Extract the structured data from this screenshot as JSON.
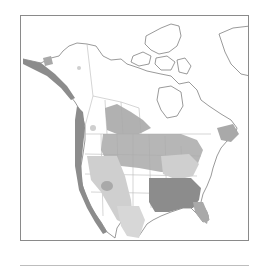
{
  "map": {
    "title": "North America range map",
    "region": "North America",
    "style": "grayscale",
    "legend_shades": [
      {
        "name": "dark",
        "color": "#8c8c8c"
      },
      {
        "name": "medium",
        "color": "#a9a9a9"
      },
      {
        "name": "light",
        "color": "#cfcfcf"
      },
      {
        "name": "unshaded",
        "color": "#ffffff"
      }
    ],
    "colors": {
      "border": "#8a8a8a",
      "outline": "#6e6e6e",
      "boundary": "#b8b8b8",
      "rule": "#bdbdbd"
    }
  }
}
